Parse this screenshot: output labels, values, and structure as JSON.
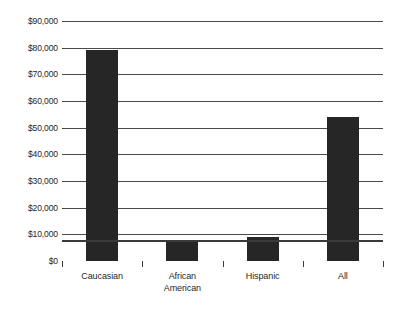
{
  "chart_data": {
    "type": "bar",
    "title": "",
    "subtitle": "",
    "xlabel": "",
    "ylabel": "",
    "categories": [
      "Caucasian",
      "African\nAmerican",
      "Hispanic",
      "All"
    ],
    "values": [
      79000,
      7000,
      9000,
      54000
    ],
    "ylim": [
      0,
      90000
    ],
    "ytick_step": 10000,
    "ytick_labels": [
      "$0",
      "$10,000",
      "$20,000",
      "$30,000",
      "$40,000",
      "$50,000",
      "$60,000",
      "$70,000",
      "$80,000",
      "$90,000"
    ],
    "ytick_values": [
      0,
      10000,
      20000,
      30000,
      40000,
      50000,
      60000,
      70000,
      80000,
      90000
    ],
    "grid": true,
    "grid_axis": "y",
    "legend": false,
    "legend_position": "none",
    "bar_color": "#262626",
    "gridline_color": "#4a4a4a",
    "axis_color": "#3a3a3a",
    "background_color": "#ffffff"
  }
}
